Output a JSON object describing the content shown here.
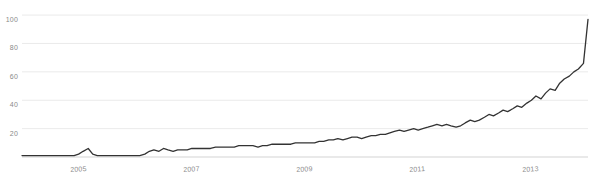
{
  "chart_data": {
    "type": "line",
    "title": "",
    "subtitle": "",
    "xlabel": "",
    "ylabel": "",
    "xlim": [
      2004.0,
      2014.0
    ],
    "ylim": [
      0,
      105
    ],
    "grid": true,
    "grid_axis": "y",
    "legend": null,
    "legend_position": "none",
    "line_color": "#333333",
    "grid_color": "#e8e8e8",
    "tick_label_color": "#8a8a8a",
    "background_color": "#ffffff",
    "y_ticks": [
      20,
      40,
      60,
      80,
      100
    ],
    "y_tick_labels": [
      "20",
      "40",
      "60",
      "80",
      "100"
    ],
    "x_ticks": [
      2005,
      2007,
      2009,
      2011,
      2013
    ],
    "x_tick_labels": [
      "2005",
      "2007",
      "2009",
      "2011",
      "2013"
    ],
    "x": [
      2004.0,
      2004.08,
      2004.17,
      2004.25,
      2004.33,
      2004.42,
      2004.5,
      2004.58,
      2004.67,
      2004.75,
      2004.83,
      2004.92,
      2005.0,
      2005.08,
      2005.17,
      2005.25,
      2005.33,
      2005.42,
      2005.5,
      2005.58,
      2005.67,
      2005.75,
      2005.83,
      2005.92,
      2006.0,
      2006.08,
      2006.17,
      2006.25,
      2006.33,
      2006.42,
      2006.5,
      2006.58,
      2006.67,
      2006.75,
      2006.83,
      2006.92,
      2007.0,
      2007.08,
      2007.17,
      2007.25,
      2007.33,
      2007.42,
      2007.5,
      2007.58,
      2007.67,
      2007.75,
      2007.83,
      2007.92,
      2008.0,
      2008.08,
      2008.17,
      2008.25,
      2008.33,
      2008.42,
      2008.5,
      2008.58,
      2008.67,
      2008.75,
      2008.83,
      2008.92,
      2009.0,
      2009.08,
      2009.17,
      2009.25,
      2009.33,
      2009.42,
      2009.5,
      2009.58,
      2009.67,
      2009.75,
      2009.83,
      2009.92,
      2010.0,
      2010.08,
      2010.17,
      2010.25,
      2010.33,
      2010.42,
      2010.5,
      2010.58,
      2010.67,
      2010.75,
      2010.83,
      2010.92,
      2011.0,
      2011.08,
      2011.17,
      2011.25,
      2011.33,
      2011.42,
      2011.5,
      2011.58,
      2011.67,
      2011.75,
      2011.83,
      2011.92,
      2012.0,
      2012.08,
      2012.17,
      2012.25,
      2012.33,
      2012.42,
      2012.5,
      2012.58,
      2012.67,
      2012.75,
      2012.83,
      2012.92,
      2013.0,
      2013.08,
      2013.17,
      2013.25,
      2013.33,
      2013.42,
      2013.5,
      2013.58,
      2013.67,
      2013.75,
      2013.83,
      2013.92,
      2014.0
    ],
    "y": [
      1,
      1,
      1,
      1,
      1,
      1,
      1,
      1,
      1,
      1,
      1,
      1,
      2,
      4,
      6,
      2,
      1,
      1,
      1,
      1,
      1,
      1,
      1,
      1,
      1,
      1,
      2,
      4,
      5,
      4,
      6,
      5,
      4,
      5,
      5,
      5,
      6,
      6,
      6,
      6,
      6,
      7,
      7,
      7,
      7,
      7,
      8,
      8,
      8,
      8,
      7,
      8,
      8,
      9,
      9,
      9,
      9,
      9,
      10,
      10,
      10,
      10,
      10,
      11,
      11,
      12,
      12,
      13,
      12,
      13,
      14,
      14,
      13,
      14,
      15,
      15,
      16,
      16,
      17,
      18,
      19,
      18,
      19,
      20,
      19,
      20,
      21,
      22,
      23,
      22,
      23,
      22,
      21,
      22,
      24,
      26,
      25,
      26,
      28,
      30,
      29,
      31,
      33,
      32,
      34,
      36,
      35,
      38,
      40,
      43,
      41,
      45,
      48,
      47,
      52,
      55,
      57,
      60,
      62,
      66,
      97
    ]
  }
}
